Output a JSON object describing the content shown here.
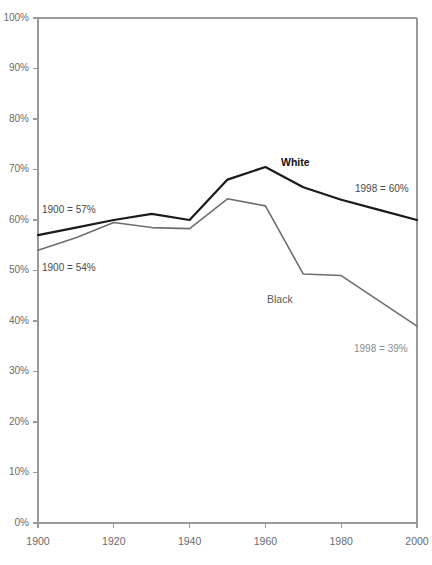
{
  "chart_data": {
    "type": "line",
    "title": "",
    "subtitle": "",
    "xlabel": "",
    "ylabel": "",
    "xlim": [
      1900,
      2000
    ],
    "ylim": [
      0,
      100
    ],
    "grid": false,
    "legend_position": "inline-labels",
    "x_tick_labels": [
      "1900",
      "1920",
      "1940",
      "1960",
      "1980",
      "2000"
    ],
    "x_ticks": [
      1900,
      1920,
      1940,
      1960,
      1980,
      2000
    ],
    "y_tick_labels": [
      "0%",
      "10%",
      "20%",
      "30%",
      "40%",
      "50%",
      "60%",
      "70%",
      "80%",
      "90%",
      "100%"
    ],
    "y_ticks": [
      0,
      10,
      20,
      30,
      40,
      50,
      60,
      70,
      80,
      90,
      100
    ],
    "x": [
      1900,
      1910,
      1920,
      1930,
      1940,
      1950,
      1960,
      1970,
      1980,
      1990,
      2000
    ],
    "series": [
      {
        "name": "White",
        "color": "#1a1a1a",
        "stroke_width": 2.2,
        "values": [
          57,
          58.5,
          60,
          61.2,
          60,
          68,
          70.5,
          66.5,
          64,
          62,
          60
        ]
      },
      {
        "name": "Black",
        "color": "#6e6e6e",
        "stroke_width": 1.6,
        "values": [
          54,
          56.5,
          59.5,
          58.5,
          58.3,
          64.2,
          62.8,
          49.3,
          49,
          44,
          39
        ]
      }
    ],
    "annotations": [
      {
        "id": "white-start",
        "text": "1900 = 57%",
        "x_px": 42,
        "y_px": 213,
        "style": "anno-dark",
        "anchor": "start"
      },
      {
        "id": "black-start",
        "text": "1900 = 54%",
        "x_px": 42,
        "y_px": 271,
        "style": "anno-dark",
        "anchor": "start"
      },
      {
        "id": "white-end",
        "text": "1998 = 60%",
        "x_px": 355,
        "y_px": 192,
        "style": "anno-dark",
        "anchor": "start"
      },
      {
        "id": "black-end",
        "text": "1998 = 39%",
        "x_px": 354,
        "y_px": 352,
        "style": "anno-gray",
        "anchor": "start"
      }
    ],
    "series_labels": [
      {
        "id": "white-series-label",
        "text": "White",
        "x_px": 281,
        "y_px": 166,
        "style": "series-label-white"
      },
      {
        "id": "black-series-label",
        "text": "Black",
        "x_px": 267,
        "y_px": 303,
        "style": "series-label-black"
      }
    ],
    "colors": {
      "white_series": "#1a1a1a",
      "black_series": "#6e6e6e",
      "axis": "#9a9a9a",
      "tick_text": "#6b6b6b",
      "background": "#ffffff"
    },
    "plot_area_px": {
      "left": 38,
      "right": 417,
      "top": 18,
      "bottom": 523
    }
  }
}
